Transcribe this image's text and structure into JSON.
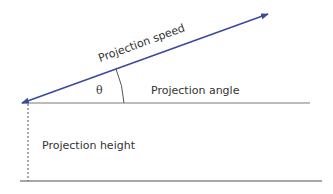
{
  "diagram": {
    "labels": {
      "speed": "Projection speed",
      "angle": "Projection angle",
      "height": "Projection height",
      "theta": "θ"
    },
    "colors": {
      "arrow": "#3b4a9a",
      "line": "#7a7a7a",
      "text": "#333333"
    }
  }
}
